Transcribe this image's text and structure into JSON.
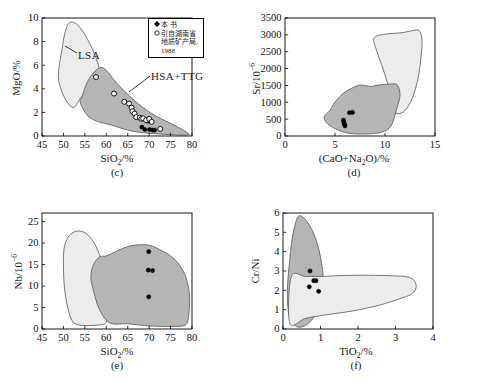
{
  "figure": {
    "panels": [
      "c",
      "d",
      "e",
      "f"
    ],
    "fields": {
      "lsa_label": "LSA",
      "hsa_label": "HSA+TTG"
    },
    "colors": {
      "lsa_fill": "#ececec",
      "hsa_fill": "#b5b5b5",
      "outline": "#555555",
      "marker_filled": "#000000",
      "marker_open": "#ffffff",
      "axis": "#000000"
    }
  },
  "legend": {
    "items": [
      {
        "symbol": "filled-diamond",
        "label": "本 书"
      },
      {
        "symbol": "open-circle",
        "label": "引自湖南省"
      },
      {
        "symbol": "none",
        "label": "地质矿产局,"
      },
      {
        "symbol": "none",
        "label": "1988"
      }
    ]
  },
  "chart_data": [
    {
      "id": "c",
      "type": "scatter",
      "panel_label": "(c)",
      "xlabel": "SiO2/%",
      "ylabel": "MgO/%",
      "xlim": [
        45,
        80
      ],
      "ylim": [
        0,
        10
      ],
      "xticks": [
        45,
        50,
        55,
        60,
        65,
        70,
        75,
        80
      ],
      "yticks": [
        0,
        2,
        4,
        6,
        8,
        10
      ],
      "grid": false,
      "annotations": [
        "LSA",
        "HSA+TTG"
      ],
      "fields": [
        {
          "name": "LSA",
          "fill": "#ececec",
          "points": [
            [
              48.8,
              5.1
            ],
            [
              49.6,
              7.2
            ],
            [
              50.4,
              8.8
            ],
            [
              51.4,
              9.6
            ],
            [
              53.0,
              9.5
            ],
            [
              55.0,
              8.6
            ],
            [
              57.2,
              7.0
            ],
            [
              58.7,
              5.3
            ],
            [
              59.4,
              3.9
            ],
            [
              58.6,
              3.3
            ],
            [
              56.2,
              3.2
            ],
            [
              54.2,
              3.3
            ],
            [
              53.6,
              3.0
            ],
            [
              52.4,
              2.4
            ],
            [
              51.0,
              2.8
            ],
            [
              49.6,
              3.8
            ]
          ]
        },
        {
          "name": "HSA+TTG",
          "fill": "#b5b5b5",
          "points": [
            [
              54.3,
              3.3
            ],
            [
              55.6,
              4.6
            ],
            [
              57.4,
              5.5
            ],
            [
              59.0,
              5.8
            ],
            [
              60.4,
              5.4
            ],
            [
              62.6,
              4.4
            ],
            [
              65.4,
              3.4
            ],
            [
              68.6,
              2.4
            ],
            [
              72.0,
              1.6
            ],
            [
              75.4,
              1.0
            ],
            [
              78.6,
              0.35
            ],
            [
              79.2,
              0.1
            ],
            [
              76.0,
              0.1
            ],
            [
              71.0,
              0.2
            ],
            [
              67.0,
              0.35
            ],
            [
              64.0,
              0.6
            ],
            [
              61.0,
              0.95
            ],
            [
              58.2,
              1.2
            ],
            [
              56.0,
              1.6
            ],
            [
              54.6,
              2.3
            ],
            [
              53.9,
              2.9
            ]
          ]
        }
      ],
      "series": [
        {
          "name": "本 书",
          "marker": "filled-circle",
          "points": [
            [
              68.3,
              0.75
            ],
            [
              69.0,
              0.55
            ],
            [
              69.4,
              1.3
            ],
            [
              69.8,
              1.25
            ],
            [
              70.1,
              0.55
            ],
            [
              70.4,
              1.25
            ],
            [
              70.8,
              0.5
            ],
            [
              71.3,
              0.5
            ]
          ]
        },
        {
          "name": "引自湖南省地质矿产局, 1988",
          "marker": "open-circle",
          "points": [
            [
              57.6,
              5.0
            ],
            [
              61.8,
              3.6
            ],
            [
              64.2,
              2.9
            ],
            [
              65.3,
              2.75
            ],
            [
              65.9,
              2.4
            ],
            [
              66.1,
              2.1
            ],
            [
              66.6,
              1.9
            ],
            [
              67.0,
              1.6
            ],
            [
              67.8,
              1.55
            ],
            [
              68.2,
              1.45
            ],
            [
              68.6,
              1.5
            ],
            [
              69.3,
              1.35
            ],
            [
              70.0,
              1.45
            ],
            [
              70.6,
              1.2
            ],
            [
              72.6,
              0.6
            ]
          ]
        }
      ]
    },
    {
      "id": "d",
      "type": "scatter",
      "panel_label": "(d)",
      "xlabel": "(CaO+Na2O)/%",
      "ylabel": "Sr/10-6",
      "xlim": [
        0,
        15
      ],
      "ylim": [
        0,
        3500
      ],
      "xticks": [
        0,
        5,
        10,
        15
      ],
      "yticks": [
        0,
        500,
        1000,
        1500,
        2000,
        2500,
        3000,
        3500
      ],
      "grid": false,
      "fields": [
        {
          "name": "LSA",
          "fill": "#ececec",
          "points": [
            [
              8.9,
              2900
            ],
            [
              10.0,
              3020
            ],
            [
              11.6,
              3060
            ],
            [
              12.7,
              3120
            ],
            [
              13.4,
              3130
            ],
            [
              13.7,
              2850
            ],
            [
              13.6,
              2350
            ],
            [
              13.3,
              1700
            ],
            [
              12.7,
              1100
            ],
            [
              12.0,
              760
            ],
            [
              11.3,
              660
            ],
            [
              10.7,
              790
            ],
            [
              10.4,
              1100
            ],
            [
              10.3,
              1500
            ],
            [
              9.8,
              1990
            ],
            [
              9.2,
              2500
            ]
          ]
        },
        {
          "name": "HSA+TTG",
          "fill": "#b5b5b5",
          "points": [
            [
              4.5,
              760
            ],
            [
              5.0,
              1010
            ],
            [
              5.9,
              1280
            ],
            [
              6.9,
              1450
            ],
            [
              7.6,
              1510
            ],
            [
              8.6,
              1470
            ],
            [
              9.3,
              1510
            ],
            [
              10.4,
              1540
            ],
            [
              11.2,
              1520
            ],
            [
              11.5,
              1220
            ],
            [
              11.2,
              840
            ],
            [
              10.6,
              300
            ],
            [
              9.6,
              110
            ],
            [
              8.0,
              60
            ],
            [
              6.4,
              80
            ],
            [
              5.3,
              180
            ],
            [
              4.3,
              350
            ],
            [
              3.9,
              560
            ]
          ]
        }
      ],
      "series": [
        {
          "name": "本 书",
          "marker": "filled-circle",
          "points": [
            [
              5.85,
              470
            ],
            [
              5.9,
              400
            ],
            [
              5.95,
              345
            ],
            [
              6.0,
              300
            ],
            [
              6.45,
              690
            ],
            [
              6.75,
              700
            ]
          ]
        }
      ]
    },
    {
      "id": "e",
      "type": "scatter",
      "panel_label": "(e)",
      "xlabel": "SiO2/%",
      "ylabel": "Nb/10-6",
      "xlim": [
        45,
        80
      ],
      "ylim": [
        0,
        27
      ],
      "xticks": [
        45,
        50,
        55,
        60,
        65,
        70,
        75,
        80
      ],
      "yticks": [
        0,
        5,
        10,
        15,
        20,
        25
      ],
      "grid": false,
      "fields": [
        {
          "name": "LSA",
          "fill": "#ececec",
          "points": [
            [
              50.0,
              16.0
            ],
            [
              50.3,
              19.5
            ],
            [
              51.4,
              21.8
            ],
            [
              53.2,
              22.8
            ],
            [
              55.2,
              22.3
            ],
            [
              57.0,
              20.3
            ],
            [
              58.3,
              17.6
            ],
            [
              59.6,
              14.0
            ],
            [
              60.0,
              10.5
            ],
            [
              60.0,
              5.5
            ],
            [
              60.0,
              1.6
            ],
            [
              58.0,
              0.9
            ],
            [
              55.6,
              0.8
            ],
            [
              53.4,
              1.0
            ],
            [
              52.0,
              2.0
            ],
            [
              51.0,
              5.0
            ],
            [
              50.2,
              10.0
            ]
          ]
        },
        {
          "name": "HSA+TTG",
          "fill": "#b5b5b5",
          "points": [
            [
              57.0,
              15.0
            ],
            [
              58.5,
              16.8
            ],
            [
              60.0,
              17.0
            ],
            [
              62.6,
              18.2
            ],
            [
              65.0,
              19.2
            ],
            [
              67.6,
              19.6
            ],
            [
              70.4,
              19.4
            ],
            [
              73.0,
              18.2
            ],
            [
              75.0,
              17.0
            ],
            [
              77.0,
              15.0
            ],
            [
              78.6,
              12.0
            ],
            [
              79.4,
              8.0
            ],
            [
              79.2,
              3.0
            ],
            [
              78.4,
              0.9
            ],
            [
              75.0,
              0.6
            ],
            [
              70.0,
              0.7
            ],
            [
              65.0,
              1.2
            ],
            [
              61.5,
              1.2
            ],
            [
              59.6,
              2.5
            ],
            [
              58.0,
              5.5
            ],
            [
              57.0,
              9.0
            ],
            [
              56.4,
              12.0
            ]
          ]
        }
      ],
      "series": [
        {
          "name": "本 书",
          "marker": "filled-circle",
          "points": [
            [
              69.9,
              18.0
            ],
            [
              69.8,
              13.7
            ],
            [
              70.8,
              13.6
            ],
            [
              69.9,
              7.5
            ]
          ]
        }
      ]
    },
    {
      "id": "f",
      "type": "scatter",
      "panel_label": "(f)",
      "xlabel": "TiO2/%",
      "ylabel": "Cr/Ni",
      "xlim": [
        0,
        4
      ],
      "ylim": [
        0,
        6
      ],
      "xticks": [
        0,
        1,
        2,
        3,
        4
      ],
      "yticks": [
        0,
        1,
        2,
        3,
        4,
        5,
        6
      ],
      "grid": false,
      "fields": [
        {
          "name": "HSA+TTG",
          "fill": "#b5b5b5",
          "points": [
            [
              0.33,
              5.45
            ],
            [
              0.42,
              5.85
            ],
            [
              0.58,
              5.7
            ],
            [
              0.78,
              5.1
            ],
            [
              0.93,
              4.3
            ],
            [
              1.03,
              3.4
            ],
            [
              1.07,
              2.7
            ],
            [
              1.06,
              2.0
            ],
            [
              1.0,
              1.35
            ],
            [
              0.88,
              0.78
            ],
            [
              0.7,
              0.33
            ],
            [
              0.52,
              0.12
            ],
            [
              0.36,
              0.13
            ],
            [
              0.22,
              0.45
            ],
            [
              0.13,
              1.1
            ],
            [
              0.12,
              2.2
            ],
            [
              0.17,
              3.4
            ],
            [
              0.24,
              4.6
            ]
          ]
        },
        {
          "name": "LSA",
          "fill": "#ececec",
          "points": [
            [
              0.18,
              0.3
            ],
            [
              0.6,
              0.55
            ],
            [
              1.1,
              0.72
            ],
            [
              1.9,
              0.95
            ],
            [
              2.6,
              1.25
            ],
            [
              3.2,
              1.62
            ],
            [
              3.45,
              1.84
            ],
            [
              3.55,
              2.15
            ],
            [
              3.5,
              2.5
            ],
            [
              3.3,
              2.7
            ],
            [
              2.8,
              2.76
            ],
            [
              2.1,
              2.78
            ],
            [
              1.45,
              2.76
            ],
            [
              1.1,
              2.72
            ],
            [
              0.6,
              2.72
            ],
            [
              0.22,
              2.7
            ]
          ]
        }
      ],
      "series": [
        {
          "name": "本 书",
          "marker": "filled-circle",
          "points": [
            [
              0.72,
              3.0
            ],
            [
              0.7,
              2.18
            ],
            [
              0.82,
              2.5
            ],
            [
              0.88,
              2.5
            ],
            [
              0.95,
              1.95
            ]
          ]
        }
      ]
    }
  ]
}
